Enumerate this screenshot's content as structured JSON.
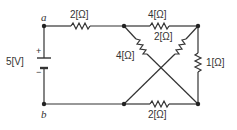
{
  "diagram": {
    "type": "circuit",
    "nodes": {
      "a": "a",
      "b": "b"
    },
    "source": {
      "label": "5[V]",
      "plus": "+",
      "minus": "−"
    },
    "resistors": {
      "r_a": "2[Ω]",
      "r_top": "4[Ω]",
      "r_diag_left": "4[Ω]",
      "r_diag_right": "2[Ω]",
      "r_right": "1[Ω]",
      "r_bottom": "2[Ω]"
    },
    "colors": {
      "wire": "#333333",
      "text": "#333333",
      "background": "#ffffff"
    }
  }
}
